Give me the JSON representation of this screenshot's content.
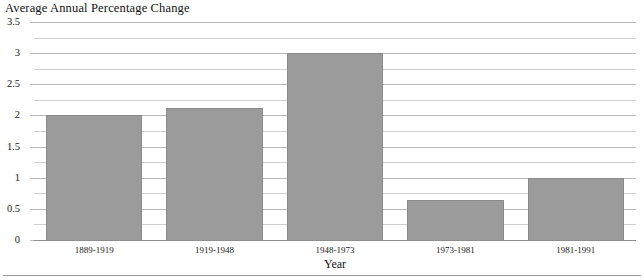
{
  "chart_data": {
    "type": "bar",
    "title": "Average Annual Percentage Change",
    "xlabel": "Year",
    "ylabel": "",
    "categories": [
      "1889-1919",
      "1919-1948",
      "1948-1973",
      "1973-1981",
      "1981-1991"
    ],
    "values": [
      2.0,
      2.12,
      3.0,
      0.65,
      1.0
    ],
    "ylim": [
      0,
      3.5
    ],
    "ytick_labels": [
      "0",
      "0.5",
      "1",
      "1.5",
      "2",
      "2.5",
      "3",
      "3.5"
    ],
    "ytick_values": [
      0,
      0.5,
      1,
      1.5,
      2,
      2.5,
      3,
      3.5
    ],
    "minor_ytick_values": [
      0.25,
      0.75,
      1.25,
      1.75,
      2.25,
      2.75,
      3.25
    ],
    "grid": true,
    "legend": null,
    "bar_color": "#9b9b9b",
    "gridline_color": "#b9b9b9",
    "minor_gridline_color": "#cfcfcf"
  },
  "figure": {
    "title": "Average Annual Percentage Change",
    "x_axis_title": "Year"
  }
}
